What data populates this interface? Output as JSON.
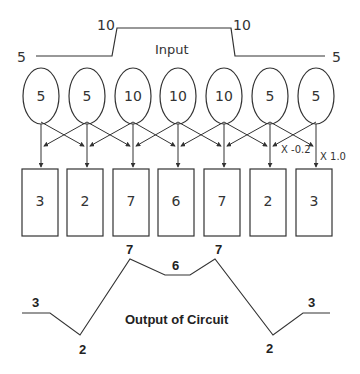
{
  "input": {
    "title": "Input",
    "low_left_label": "5",
    "high_left_label": "10",
    "high_right_label": "10",
    "low_right_label": "5"
  },
  "neurons": [
    {
      "value": "5"
    },
    {
      "value": "5"
    },
    {
      "value": "10"
    },
    {
      "value": "10"
    },
    {
      "value": "10"
    },
    {
      "value": "5"
    },
    {
      "value": "5"
    }
  ],
  "weights": {
    "lateral": "X -0.2",
    "direct": "X 1.0"
  },
  "outputs": [
    {
      "value": "3"
    },
    {
      "value": "2"
    },
    {
      "value": "7"
    },
    {
      "value": "6"
    },
    {
      "value": "7"
    },
    {
      "value": "2"
    },
    {
      "value": "3"
    }
  ],
  "output_curve": {
    "title": "Output of Circuit",
    "labels": [
      "3",
      "2",
      "7",
      "6",
      "7",
      "2",
      "3"
    ]
  },
  "colors": {
    "stroke": "#333333",
    "background": "#ffffff"
  }
}
